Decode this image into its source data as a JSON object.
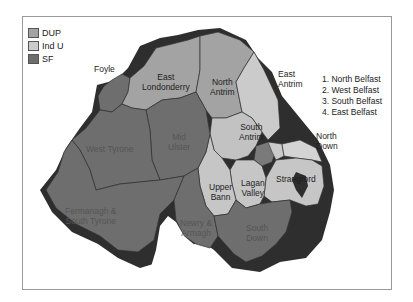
{
  "legend": {
    "items": [
      {
        "label": "DUP",
        "color": "#a3a3a3"
      },
      {
        "label": "Ind U",
        "color": "#cbcbcb"
      },
      {
        "label": "SF",
        "color": "#6e6e6e"
      }
    ]
  },
  "belfast_key": [
    "1. North Belfast",
    "2. West Belfast",
    "3. South Belfast",
    "4. East Belfast"
  ],
  "constituencies": {
    "foyle": "Foyle",
    "east_londonderry": "East Londonderry",
    "north_antrim": "North Antrim",
    "east_antrim": "East Antrim",
    "south_antrim": "South Antrim",
    "north_down": "North Down",
    "strangford": "Strangford",
    "lagan_valley": "Lagan Valley",
    "upper_bann": "Upper Bann",
    "mid_ulster": "Mid Ulster",
    "west_tyrone": "West Tyrone",
    "fermanagh_south_tyrone": "Fermanagh & South Tyrone",
    "newry_armagh": "Newry & Armagh",
    "south_down": "South Down"
  },
  "labels": {
    "foyle": "Foyle",
    "east_londonderry_1": "East",
    "east_londonderry_2": "Londonderry",
    "north_antrim_1": "North",
    "north_antrim_2": "Antrim",
    "east_antrim_1": "East",
    "east_antrim_2": "Antrim",
    "south_antrim_1": "South",
    "south_antrim_2": "Antrim",
    "north_down_1": "North",
    "north_down_2": "Down",
    "strangford": "Strangford",
    "lagan_valley_1": "Lagan",
    "lagan_valley_2": "Valley",
    "upper_bann_1": "Upper",
    "upper_bann_2": "Bann",
    "mid_ulster_1": "Mid",
    "mid_ulster_2": "Ulster",
    "west_tyrone": "West Tyrone",
    "fermanagh_1": "Fermanagh &",
    "fermanagh_2": "South Tyrone",
    "newry_1": "Newry &",
    "newry_2": "Armagh",
    "south_down_1": "South",
    "south_down_2": "Down"
  }
}
